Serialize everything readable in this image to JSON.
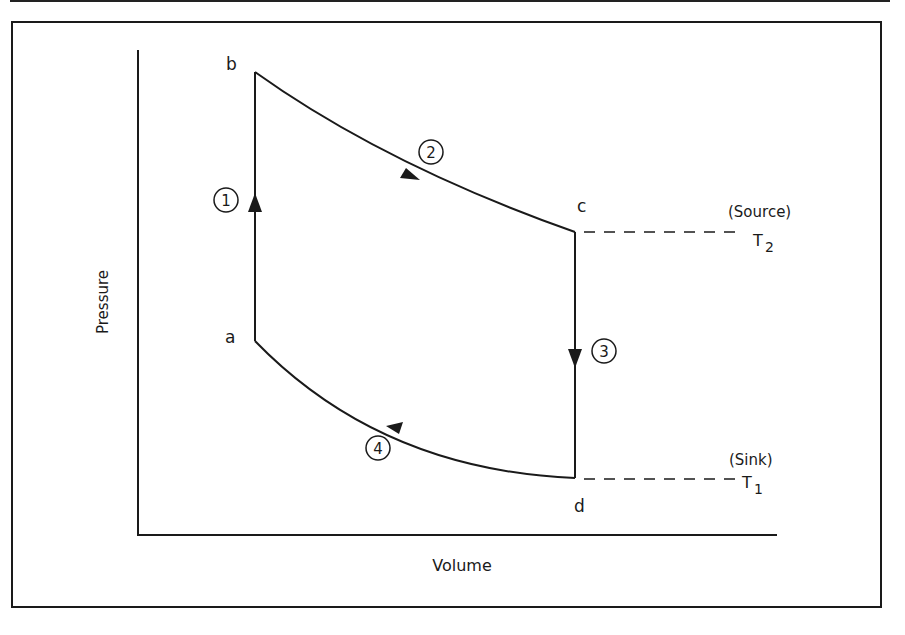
{
  "diagram": {
    "type": "pv-cycle",
    "axes": {
      "x_label": "Volume",
      "y_label": "Pressure"
    },
    "states": [
      {
        "id": "a",
        "label": "a"
      },
      {
        "id": "b",
        "label": "b"
      },
      {
        "id": "c",
        "label": "c"
      },
      {
        "id": "d",
        "label": "d"
      }
    ],
    "processes": [
      {
        "number": "1",
        "from": "a",
        "to": "b",
        "shape": "vertical line, upward"
      },
      {
        "number": "2",
        "from": "b",
        "to": "c",
        "shape": "curve, downward to the right"
      },
      {
        "number": "3",
        "from": "c",
        "to": "d",
        "shape": "vertical line, downward"
      },
      {
        "number": "4",
        "from": "d",
        "to": "a",
        "shape": "curve, upward to the left"
      }
    ],
    "reservoirs": {
      "source": {
        "label": "(Source)",
        "temp_symbol": "T",
        "temp_subscript": "2",
        "attached_state": "c"
      },
      "sink": {
        "label": "(Sink)",
        "temp_symbol": "T",
        "temp_subscript": "1",
        "attached_state": "d"
      }
    }
  }
}
